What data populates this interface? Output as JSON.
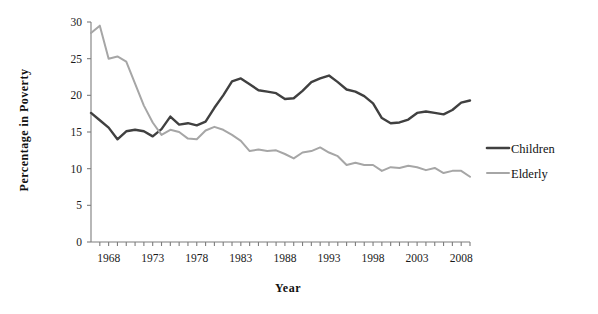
{
  "chart_data": {
    "type": "line",
    "title": "",
    "subtitle": "",
    "xlabel": "Year",
    "ylabel": "Percentage in Poverty",
    "xlim": [
      1966,
      2009
    ],
    "ylim": [
      0,
      30
    ],
    "grid": false,
    "legend_position": "right",
    "y_ticks": [
      0,
      5,
      10,
      15,
      20,
      25,
      30
    ],
    "y_tick_labels": [
      "0",
      "5",
      "10",
      "15",
      "20",
      "25",
      "30"
    ],
    "x_ticks": [
      1968,
      1973,
      1978,
      1983,
      1988,
      1993,
      1998,
      2003,
      2008
    ],
    "x_tick_labels": [
      "1968",
      "1973",
      "1978",
      "1983",
      "1988",
      "1993",
      "1998",
      "2003",
      "2008"
    ],
    "x": [
      1966,
      1967,
      1968,
      1969,
      1970,
      1971,
      1972,
      1973,
      1974,
      1975,
      1976,
      1977,
      1978,
      1979,
      1980,
      1981,
      1982,
      1983,
      1984,
      1985,
      1986,
      1987,
      1988,
      1989,
      1990,
      1991,
      1992,
      1993,
      1994,
      1995,
      1996,
      1997,
      1998,
      1999,
      2000,
      2001,
      2002,
      2003,
      2004,
      2005,
      2006,
      2007,
      2008,
      2009
    ],
    "series": [
      {
        "name": "Children",
        "color": "#404040",
        "values": [
          17.6,
          16.6,
          15.6,
          14.0,
          15.1,
          15.3,
          15.1,
          14.4,
          15.4,
          17.1,
          16.0,
          16.2,
          15.9,
          16.4,
          18.3,
          20.0,
          21.9,
          22.3,
          21.5,
          20.7,
          20.5,
          20.3,
          19.5,
          19.6,
          20.6,
          21.8,
          22.3,
          22.7,
          21.8,
          20.8,
          20.5,
          19.9,
          18.9,
          16.9,
          16.2,
          16.3,
          16.7,
          17.6,
          17.8,
          17.6,
          17.4,
          18.0,
          19.0,
          19.3
        ]
      },
      {
        "name": "Elderly",
        "color": "#a6a6a6",
        "values": [
          28.5,
          29.5,
          25.0,
          25.3,
          24.6,
          21.6,
          18.6,
          16.3,
          14.6,
          15.3,
          15.0,
          14.1,
          14.0,
          15.2,
          15.7,
          15.3,
          14.6,
          13.8,
          12.4,
          12.6,
          12.4,
          12.5,
          12.0,
          11.4,
          12.2,
          12.4,
          12.9,
          12.2,
          11.7,
          10.5,
          10.8,
          10.5,
          10.5,
          9.7,
          10.2,
          10.1,
          10.4,
          10.2,
          9.8,
          10.1,
          9.4,
          9.7,
          9.7,
          8.9
        ]
      }
    ]
  },
  "legend": {
    "items": [
      {
        "label": "Children",
        "color": "#404040"
      },
      {
        "label": "Elderly",
        "color": "#a6a6a6"
      }
    ]
  }
}
